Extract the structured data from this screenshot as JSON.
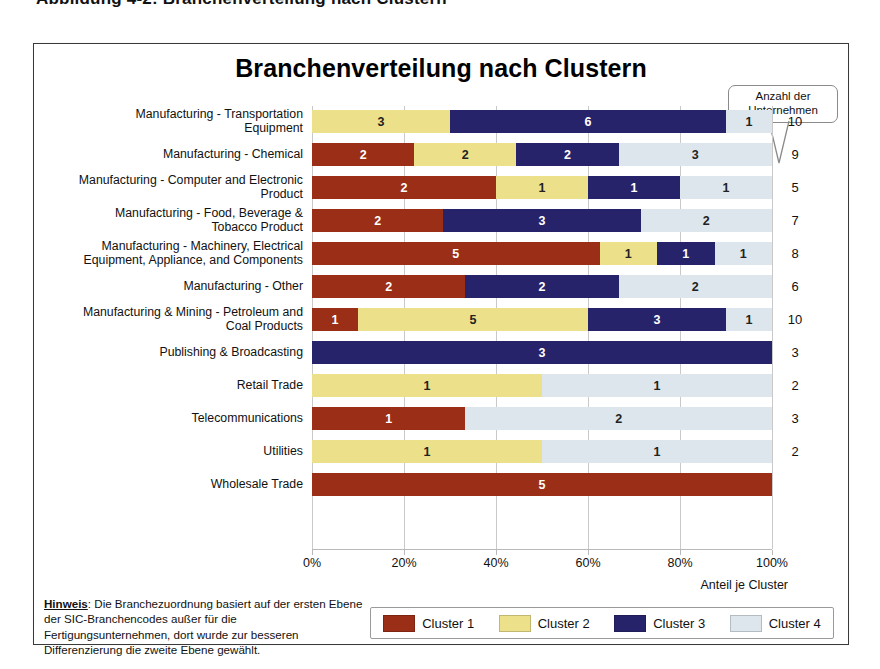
{
  "top_caption": "Abbildung 4-2: Branchenverteilung nach Clustern",
  "chart": {
    "title": "Branchenverteilung nach Clustern",
    "callout": {
      "line1": "Anzahl der",
      "line2": "Unternehmen"
    },
    "axis_title": "Anteil je Cluster",
    "note_label": "Hinweis",
    "note_text": ": Die Branchezuordnung basiert auf der ersten Ebene der SIC-Branchencodes außer für die Fertigungsunternehmen, dort wurde zur besseren Differenzierung die zweite Ebene gewählt."
  },
  "colors": {
    "cluster1": "#9a2e16",
    "cluster2": "#ede08a",
    "cluster3": "#27236b",
    "cluster4": "#dce6ec",
    "grid": "#c9c9c9",
    "frame": "#3a3a3a"
  },
  "chart_data": {
    "type": "bar",
    "orientation": "horizontal",
    "stacked": true,
    "normalized": true,
    "title": "Branchenverteilung nach Clustern",
    "xlabel": "Anteil je Cluster",
    "ylabel": "",
    "xlim": [
      0,
      100
    ],
    "xticks": [
      "0%",
      "20%",
      "40%",
      "60%",
      "80%",
      "100%"
    ],
    "grid": true,
    "legend_position": "bottom",
    "series": [
      {
        "name": "Cluster 1",
        "color": "#9a2e16",
        "values": [
          0,
          2,
          2,
          2,
          5,
          2,
          1,
          0,
          0,
          1,
          0,
          5
        ]
      },
      {
        "name": "Cluster 2",
        "color": "#ede08a",
        "values": [
          3,
          2,
          1,
          0,
          1,
          0,
          5,
          0,
          1,
          0,
          1,
          0
        ]
      },
      {
        "name": "Cluster 3",
        "color": "#27236b",
        "values": [
          6,
          2,
          1,
          3,
          1,
          2,
          3,
          3,
          0,
          0,
          0,
          0
        ]
      },
      {
        "name": "Cluster 4",
        "color": "#dce6ec",
        "values": [
          1,
          3,
          1,
          2,
          1,
          2,
          1,
          0,
          1,
          2,
          1,
          0
        ]
      }
    ],
    "categories": [
      "Manufacturing - Transportation Equipment",
      "Manufacturing - Chemical",
      "Manufacturing - Computer and Electronic Product",
      "Manufacturing - Food, Beverage & Tobacco Product",
      "Manufacturing - Machinery, Electrical Equipment, Appliance, and Components",
      "Manufacturing - Other",
      "Manufacturing & Mining - Petroleum and Coal Products",
      "Publishing & Broadcasting",
      "Retail Trade",
      "Telecommunications",
      "Utilities",
      "Wholesale Trade"
    ],
    "totals": [
      10,
      9,
      5,
      7,
      8,
      6,
      10,
      3,
      2,
      3,
      2,
      5
    ]
  },
  "rows": [
    {
      "label_lines": [
        "Manufacturing - Transportation",
        "Equipment"
      ],
      "segments": [
        0,
        3,
        6,
        1
      ],
      "total": "10"
    },
    {
      "label_lines": [
        "Manufacturing - Chemical"
      ],
      "segments": [
        2,
        2,
        2,
        3
      ],
      "total": "9"
    },
    {
      "label_lines": [
        "Manufacturing - Computer and Electronic",
        "Product"
      ],
      "segments": [
        2,
        1,
        1,
        1
      ],
      "total": "5"
    },
    {
      "label_lines": [
        "Manufacturing - Food, Beverage &",
        "Tobacco Product"
      ],
      "segments": [
        2,
        0,
        3,
        2
      ],
      "total": "7"
    },
    {
      "label_lines": [
        "Manufacturing - Machinery, Electrical",
        "Equipment, Appliance, and Components"
      ],
      "segments": [
        5,
        1,
        1,
        1
      ],
      "total": "8"
    },
    {
      "label_lines": [
        "Manufacturing - Other"
      ],
      "segments": [
        2,
        0,
        2,
        2
      ],
      "total": "6"
    },
    {
      "label_lines": [
        "Manufacturing & Mining - Petroleum and",
        "Coal Products"
      ],
      "segments": [
        1,
        5,
        3,
        1
      ],
      "total": "10"
    },
    {
      "label_lines": [
        "Publishing & Broadcasting"
      ],
      "segments": [
        0,
        0,
        3,
        0
      ],
      "total": "3"
    },
    {
      "label_lines": [
        "Retail Trade"
      ],
      "segments": [
        0,
        1,
        0,
        1
      ],
      "total": "2"
    },
    {
      "label_lines": [
        "Telecommunications"
      ],
      "segments": [
        1,
        0,
        0,
        2
      ],
      "total": "3"
    },
    {
      "label_lines": [
        "Utilities"
      ],
      "segments": [
        0,
        1,
        0,
        1
      ],
      "total": "2"
    },
    {
      "label_lines": [
        "Wholesale Trade"
      ],
      "segments": [
        5,
        0,
        0,
        0
      ],
      "total": ""
    }
  ],
  "xticks": [
    "0%",
    "20%",
    "40%",
    "60%",
    "80%",
    "100%"
  ],
  "legend": [
    {
      "label": "Cluster 1",
      "color": "#9a2e16"
    },
    {
      "label": "Cluster 2",
      "color": "#ede08a"
    },
    {
      "label": "Cluster 3",
      "color": "#27236b"
    },
    {
      "label": "Cluster 4",
      "color": "#dce6ec"
    }
  ]
}
